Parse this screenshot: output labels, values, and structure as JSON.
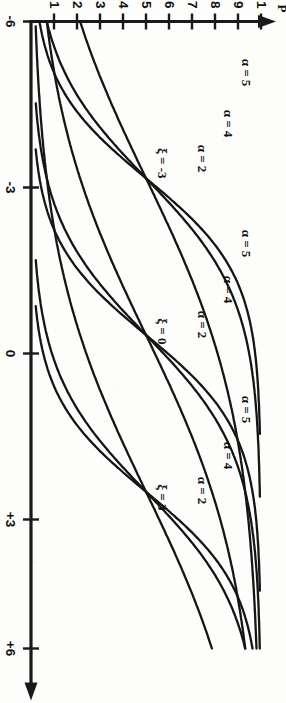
{
  "figure": {
    "orientation_note": "rotated-90-cw",
    "background_color": "#fdfdfb",
    "ink_color": "#151515"
  },
  "chart_data": {
    "type": "line",
    "title": "",
    "xlabel": "",
    "ylabel": "P",
    "xlim": [
      -6,
      6
    ],
    "ylim": [
      0,
      1
    ],
    "grid": false,
    "legend": "inline-curve-labels",
    "x_ticks": [
      {
        "value": -6,
        "label": "-6"
      },
      {
        "value": -3,
        "label": "-3"
      },
      {
        "value": 0,
        "label": "0"
      },
      {
        "value": 3,
        "label": "+3"
      },
      {
        "value": 6,
        "label": "+6"
      }
    ],
    "y_ticks": [
      {
        "value": 0.1,
        "label": "0.1"
      },
      {
        "value": 0.2,
        "label": "0.2"
      },
      {
        "value": 0.3,
        "label": "0.3"
      },
      {
        "value": 0.4,
        "label": "0.4"
      },
      {
        "value": 0.5,
        "label": "0.5"
      },
      {
        "value": 0.6,
        "label": "0.6"
      },
      {
        "value": 0.7,
        "label": "0.7"
      },
      {
        "value": 0.8,
        "label": "0.8"
      },
      {
        "value": 0.9,
        "label": "0.9"
      },
      {
        "value": 1.0,
        "label": "1"
      }
    ],
    "group_labels": [
      {
        "text": "ξ = -3",
        "xi": -3
      },
      {
        "text": "ξ = 0",
        "xi": 0
      },
      {
        "text": "ξ = 3",
        "xi": 3
      }
    ],
    "curve_labels": [
      {
        "text": "α = 5"
      },
      {
        "text": "α = 4"
      },
      {
        "text": "α = 2"
      },
      {
        "text": "α = 5"
      },
      {
        "text": "α = 4"
      },
      {
        "text": "α = 2"
      },
      {
        "text": "α = 5"
      },
      {
        "text": "α = 4"
      },
      {
        "text": "α = 2"
      }
    ],
    "series": [
      {
        "name": "ξ = -3, α = 2",
        "xi": -3,
        "alpha": 2
      },
      {
        "name": "ξ = -3, α = 4",
        "xi": -3,
        "alpha": 4
      },
      {
        "name": "ξ = -3, α = 5",
        "xi": -3,
        "alpha": 5
      },
      {
        "name": "ξ = 0, α = 2",
        "xi": 0,
        "alpha": 2
      },
      {
        "name": "ξ = 0, α = 4",
        "xi": 0,
        "alpha": 4
      },
      {
        "name": "ξ = 0, α = 5",
        "xi": 0,
        "alpha": 5
      },
      {
        "name": "ξ = 3, α = 2",
        "xi": 3,
        "alpha": 2
      },
      {
        "name": "ξ = 3, α = 4",
        "xi": 3,
        "alpha": 4
      },
      {
        "name": "ξ = 3, α = 5",
        "xi": 3,
        "alpha": 5
      }
    ],
    "crossing_points": [
      {
        "x": -3,
        "y": 0.5
      },
      {
        "x": 0,
        "y": 0.5
      },
      {
        "x": 3,
        "y": 0.5
      }
    ]
  },
  "labels": {
    "y_axis_name": "P",
    "x0": "-6",
    "x1": "-3",
    "x2": "0",
    "x3": "+3",
    "x4": "+6",
    "y01": "0.1",
    "y02": "0.2",
    "y03": "0.3",
    "y04": "0.4",
    "y05": "0.5",
    "y06": "0.6",
    "y07": "0.7",
    "y08": "0.8",
    "y09": "0.9",
    "y10": "1",
    "xi_neg3": "ξ = -3",
    "xi_0": "ξ = 0",
    "xi_3": "ξ = 3",
    "a5_a": "α = 5",
    "a4_a": "α = 4",
    "a2_a": "α = 2",
    "a5_b": "α = 5",
    "a4_b": "α = 4",
    "a2_b": "α = 2",
    "a5_c": "α = 5",
    "a4_c": "α = 4",
    "a2_c": "α = 2"
  }
}
